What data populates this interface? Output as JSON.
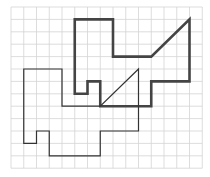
{
  "grid": {
    "cols": 15,
    "rows": 13,
    "origin_x": 11,
    "origin_y": 7,
    "cell_w": 12.75,
    "cell_h": 12.4,
    "line_color": "#d4d4d4"
  },
  "shapes": [
    {
      "name": "thick-polygon",
      "stroke": "#444444",
      "width": 2.6,
      "points": [
        [
          5,
          1
        ],
        [
          8,
          1
        ],
        [
          8,
          4
        ],
        [
          11,
          4
        ],
        [
          14,
          1
        ],
        [
          14,
          6
        ],
        [
          11,
          6
        ],
        [
          11,
          8
        ],
        [
          7,
          8
        ],
        [
          7,
          6
        ],
        [
          6,
          6
        ],
        [
          6,
          7
        ],
        [
          5,
          7
        ]
      ]
    },
    {
      "name": "thin-polygon",
      "stroke": "#333333",
      "width": 1.2,
      "points": [
        [
          1,
          5
        ],
        [
          4,
          5
        ],
        [
          4,
          8
        ],
        [
          7,
          8
        ],
        [
          10,
          5
        ],
        [
          10,
          10
        ],
        [
          7,
          10
        ],
        [
          7,
          12
        ],
        [
          3,
          12
        ],
        [
          3,
          10
        ],
        [
          2,
          10
        ],
        [
          2,
          11
        ],
        [
          1,
          11
        ]
      ]
    }
  ]
}
